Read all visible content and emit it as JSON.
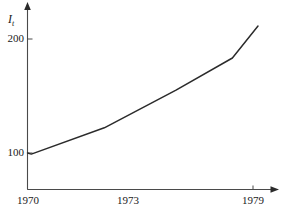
{
  "chart_data": {
    "type": "line",
    "title": "",
    "subtitle": "",
    "xlabel": "",
    "ylabel": "I_t",
    "ylabel_display": "I",
    "ylabel_subscript": "t",
    "x": [
      1970,
      1970.15,
      1973,
      1975.8,
      1978,
      1979
    ],
    "values": [
      100,
      99,
      122,
      155,
      183,
      211
    ],
    "series": [
      {
        "name": "I_t",
        "x": [
          1970,
          1970.15,
          1973,
          1975.8,
          1978,
          1979
        ],
        "values": [
          100,
          99,
          122,
          155,
          183,
          211
        ]
      }
    ],
    "xlim": [
      1970,
      1979.75
    ],
    "ylim": [
      62,
      228
    ],
    "xticks": [
      1970,
      1973,
      1979
    ],
    "xtick_labels": [
      "1970",
      "1973",
      "1979"
    ],
    "yticks": [
      100,
      200
    ],
    "ytick_labels": [
      "100",
      "200"
    ],
    "grid": false,
    "legend": false,
    "legend_position": "none",
    "line_color": "#2b2b2b",
    "axis_color": "#4a4a4a",
    "background_color": "#ffffff",
    "annotations": []
  },
  "axes": {
    "y_axis_name": "vertical-axis",
    "x_axis_name": "horizontal-axis",
    "y_arrow": "up-arrow",
    "x_arrow": "right-arrow"
  },
  "ticks": {
    "y": [
      {
        "label": "200",
        "value": 200
      },
      {
        "label": "100",
        "value": 100
      }
    ],
    "x": [
      {
        "label": "1970",
        "value": 1970
      },
      {
        "label": "1973",
        "value": 1973
      },
      {
        "label": "1979",
        "value": 1979
      }
    ]
  }
}
